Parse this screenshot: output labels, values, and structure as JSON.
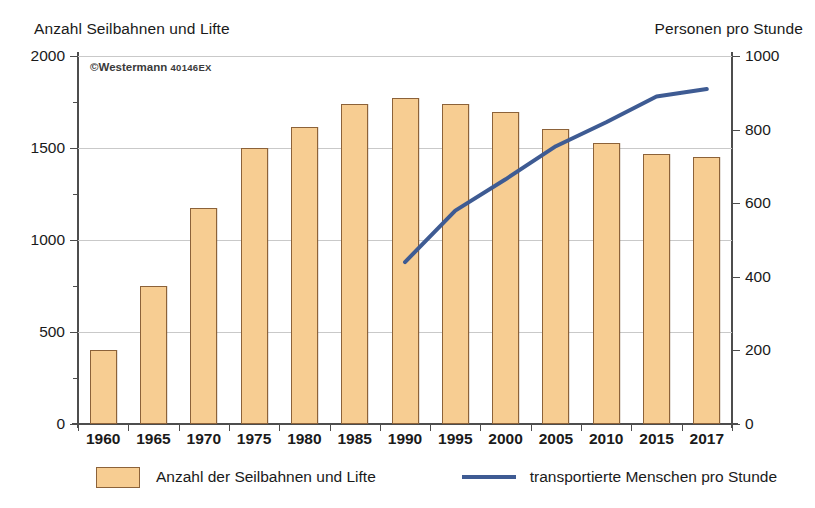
{
  "copyright": {
    "symbol": "©",
    "publisher": "Westermann",
    "code": "40146EX"
  },
  "axis_left_caption": "Anzahl Seilbahnen und Lifte",
  "axis_right_caption": "Personen pro Stunde",
  "legend": {
    "bars_label": "Anzahl der Seilbahnen und Lifte",
    "line_label": "transportierte Menschen pro Stunde"
  },
  "colors": {
    "bar_fill": "#f7cd92",
    "bar_stroke": "#8c6239",
    "line": "#3e5b93",
    "grid": "#c9c9c9",
    "axis": "#4d4d4d",
    "text": "#1a1a1a"
  },
  "chart_data": {
    "type": "bar",
    "title": "",
    "xlabel": "",
    "ylabel": "Anzahl Seilbahnen und Lifte",
    "y2label": "Personen pro Stunde",
    "grid": true,
    "legend_position": "bottom",
    "categories": [
      "1960",
      "1965",
      "1970",
      "1975",
      "1980",
      "1985",
      "1990",
      "1995",
      "2000",
      "2005",
      "2010",
      "2015",
      "2017"
    ],
    "ylim": [
      0,
      2000
    ],
    "yticks": [
      0,
      500,
      1000,
      1500,
      2000
    ],
    "ytick_labels": [
      "0",
      "500",
      "1000",
      "1500",
      "2000"
    ],
    "y2lim": [
      0,
      1000
    ],
    "y2ticks": [
      0,
      200,
      400,
      600,
      800,
      1000
    ],
    "y2tick_labels": [
      "0",
      "200",
      "400",
      "600",
      "800",
      "1000"
    ],
    "series": [
      {
        "name": "Anzahl der Seilbahnen und Lifte",
        "type": "bar",
        "axis": "left",
        "color": "#f7cd92",
        "values": [
          400,
          750,
          1175,
          1500,
          1615,
          1740,
          1770,
          1740,
          1695,
          1605,
          1525,
          1465,
          1450
        ]
      },
      {
        "name": "transportierte Menschen pro Stunde",
        "type": "line",
        "axis": "right",
        "color": "#3e5b93",
        "x": [
          "1990",
          "1995",
          "2000",
          "2005",
          "2010",
          "2015",
          "2017"
        ],
        "values": [
          440,
          580,
          665,
          755,
          820,
          890,
          910
        ]
      }
    ]
  }
}
